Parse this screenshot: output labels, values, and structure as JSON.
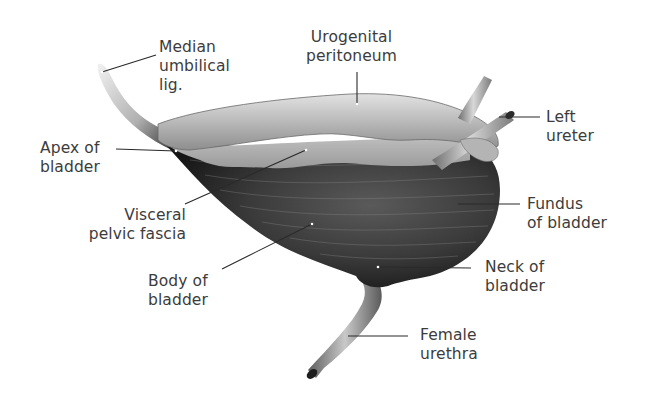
{
  "figure": {
    "colors": {
      "background": "#ffffff",
      "label_text": "#3c3c3c",
      "leader_line": "#2a2a2a",
      "muscle_dark": "#1c1c1c",
      "muscle_mid": "#4a4a4a",
      "peritoneum_light": "#cfcfcf",
      "peritoneum_mid": "#a8a8a8",
      "ligament": "#bdbdbd"
    },
    "labels": [
      {
        "id": "median-umbilical-lig",
        "lines": [
          "Median",
          "umbilical",
          "lig."
        ]
      },
      {
        "id": "urogenital-peritoneum",
        "lines": [
          "Urogenital",
          "peritoneum"
        ]
      },
      {
        "id": "left-ureter",
        "lines": [
          "Left",
          "ureter"
        ]
      },
      {
        "id": "apex-of-bladder",
        "lines": [
          "Apex of",
          "bladder"
        ]
      },
      {
        "id": "visceral-pelvic-fascia",
        "lines": [
          "Visceral",
          "pelvic fascia"
        ]
      },
      {
        "id": "fundus-of-bladder",
        "lines": [
          "Fundus",
          "of bladder"
        ]
      },
      {
        "id": "body-of-bladder",
        "lines": [
          "Body of",
          "bladder"
        ]
      },
      {
        "id": "neck-of-bladder",
        "lines": [
          "Neck of",
          "bladder"
        ]
      },
      {
        "id": "female-urethra",
        "lines": [
          "Female",
          "urethra"
        ]
      }
    ]
  }
}
